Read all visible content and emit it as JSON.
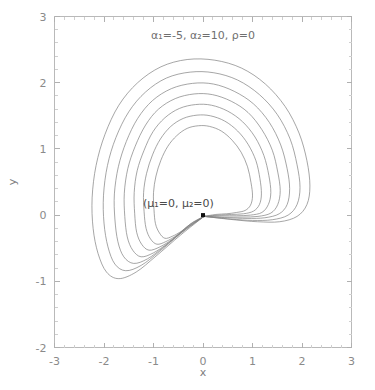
{
  "figure": {
    "name": "contour-plot",
    "title": "α₁=-5, α₂=10, ρ=0",
    "annotation": "(μ₁=0, μ₂=0)",
    "background": "#ffffff",
    "contour_color": "#7f7f7f",
    "marker_color": "#111111",
    "frame_color": "#b9b9b9"
  },
  "axes": {
    "x": {
      "label": "x",
      "ticks": [
        "-3",
        "-2",
        "-1",
        "0",
        "1",
        "2",
        "3"
      ],
      "tick_values": [
        -3,
        -2,
        -1,
        0,
        1,
        2,
        3
      ],
      "range": [
        -3,
        3
      ],
      "minor_per_interval": 4
    },
    "y": {
      "label": "y",
      "ticks": [
        "3",
        "2",
        "1",
        "0",
        "-1",
        "-2"
      ],
      "tick_values": [
        3,
        2,
        1,
        0,
        -1,
        -2
      ],
      "range": [
        -2,
        3
      ],
      "minor_per_interval": 4
    }
  },
  "chart_data": {
    "type": "line",
    "subtype": "contour",
    "title": "α₁=-5, α₂=10, ρ=0",
    "xlabel": "x",
    "ylabel": "y",
    "xlim": [
      -3,
      3
    ],
    "ylim": [
      -2,
      3
    ],
    "grid": false,
    "legend": false,
    "parameters": {
      "alpha_1": -5,
      "alpha_2": 10,
      "rho": 0,
      "mu_1": 0,
      "mu_2": 0
    },
    "annotations": [
      {
        "text": "(μ₁=0, μ₂=0)",
        "x": -0.3,
        "y": 0.15,
        "anchor": "start"
      }
    ],
    "markers": [
      {
        "name": "mean-point",
        "x": 0,
        "y": 0,
        "shape": "square",
        "color": "#111111",
        "size": 4
      }
    ],
    "n_contours": 7,
    "series": [
      {
        "name": "contour-1-outermost",
        "level": 0.01,
        "closed": true,
        "points": [
          [
            0.02,
            -0.02
          ],
          [
            -0.45,
            -0.3
          ],
          [
            -0.95,
            -0.62
          ],
          [
            -1.35,
            -0.86
          ],
          [
            -1.7,
            -0.96
          ],
          [
            -1.95,
            -0.86
          ],
          [
            -2.12,
            -0.58
          ],
          [
            -2.22,
            -0.2
          ],
          [
            -2.24,
            0.26
          ],
          [
            -2.16,
            0.75
          ],
          [
            -1.98,
            1.22
          ],
          [
            -1.7,
            1.66
          ],
          [
            -1.32,
            2.0
          ],
          [
            -0.85,
            2.24
          ],
          [
            -0.32,
            2.35
          ],
          [
            0.24,
            2.34
          ],
          [
            0.78,
            2.22
          ],
          [
            1.26,
            1.98
          ],
          [
            1.66,
            1.64
          ],
          [
            1.94,
            1.24
          ],
          [
            2.1,
            0.82
          ],
          [
            2.16,
            0.44
          ],
          [
            2.1,
            0.16
          ],
          [
            1.9,
            -0.02
          ],
          [
            1.55,
            -0.1
          ],
          [
            1.1,
            -0.1
          ],
          [
            0.62,
            -0.07
          ],
          [
            0.02,
            -0.02
          ]
        ]
      },
      {
        "name": "contour-2",
        "level": 0.02,
        "closed": true,
        "points": [
          [
            0.02,
            -0.02
          ],
          [
            -0.42,
            -0.26
          ],
          [
            -0.88,
            -0.55
          ],
          [
            -1.25,
            -0.76
          ],
          [
            -1.56,
            -0.84
          ],
          [
            -1.78,
            -0.74
          ],
          [
            -1.92,
            -0.48
          ],
          [
            -2.0,
            -0.12
          ],
          [
            -2.01,
            0.3
          ],
          [
            -1.93,
            0.75
          ],
          [
            -1.76,
            1.17
          ],
          [
            -1.5,
            1.56
          ],
          [
            -1.16,
            1.86
          ],
          [
            -0.74,
            2.07
          ],
          [
            -0.26,
            2.16
          ],
          [
            0.22,
            2.15
          ],
          [
            0.7,
            2.04
          ],
          [
            1.14,
            1.82
          ],
          [
            1.5,
            1.52
          ],
          [
            1.76,
            1.15
          ],
          [
            1.9,
            0.76
          ],
          [
            1.96,
            0.42
          ],
          [
            1.9,
            0.16
          ],
          [
            1.72,
            0.0
          ],
          [
            1.4,
            -0.07
          ],
          [
            1.0,
            -0.08
          ],
          [
            0.56,
            -0.06
          ],
          [
            0.02,
            -0.02
          ]
        ]
      },
      {
        "name": "contour-3",
        "level": 0.04,
        "closed": true,
        "points": [
          [
            0.02,
            -0.02
          ],
          [
            -0.38,
            -0.23
          ],
          [
            -0.79,
            -0.48
          ],
          [
            -1.12,
            -0.66
          ],
          [
            -1.4,
            -0.73
          ],
          [
            -1.6,
            -0.63
          ],
          [
            -1.72,
            -0.4
          ],
          [
            -1.78,
            -0.06
          ],
          [
            -1.79,
            0.32
          ],
          [
            -1.71,
            0.73
          ],
          [
            -1.55,
            1.11
          ],
          [
            -1.32,
            1.46
          ],
          [
            -1.02,
            1.73
          ],
          [
            -0.64,
            1.91
          ],
          [
            -0.21,
            1.99
          ],
          [
            0.21,
            1.98
          ],
          [
            0.63,
            1.87
          ],
          [
            1.02,
            1.68
          ],
          [
            1.34,
            1.4
          ],
          [
            1.57,
            1.06
          ],
          [
            1.7,
            0.7
          ],
          [
            1.75,
            0.4
          ],
          [
            1.7,
            0.16
          ],
          [
            1.54,
            0.02
          ],
          [
            1.25,
            -0.04
          ],
          [
            0.89,
            -0.05
          ],
          [
            0.5,
            -0.04
          ],
          [
            0.02,
            -0.02
          ]
        ]
      },
      {
        "name": "contour-4",
        "level": 0.06,
        "closed": true,
        "points": [
          [
            0.02,
            -0.02
          ],
          [
            -0.34,
            -0.2
          ],
          [
            -0.7,
            -0.42
          ],
          [
            -1.0,
            -0.57
          ],
          [
            -1.25,
            -0.63
          ],
          [
            -1.42,
            -0.53
          ],
          [
            -1.53,
            -0.33
          ],
          [
            -1.58,
            -0.02
          ],
          [
            -1.59,
            0.33
          ],
          [
            -1.52,
            0.7
          ],
          [
            -1.37,
            1.04
          ],
          [
            -1.16,
            1.36
          ],
          [
            -0.9,
            1.6
          ],
          [
            -0.56,
            1.76
          ],
          [
            -0.18,
            1.83
          ],
          [
            0.19,
            1.82
          ],
          [
            0.57,
            1.72
          ],
          [
            0.91,
            1.55
          ],
          [
            1.19,
            1.29
          ],
          [
            1.4,
            0.98
          ],
          [
            1.51,
            0.65
          ],
          [
            1.56,
            0.37
          ],
          [
            1.51,
            0.16
          ],
          [
            1.37,
            0.03
          ],
          [
            1.11,
            -0.02
          ],
          [
            0.79,
            -0.03
          ],
          [
            0.44,
            -0.03
          ],
          [
            0.02,
            -0.02
          ]
        ]
      },
      {
        "name": "contour-5",
        "level": 0.09,
        "closed": true,
        "points": [
          [
            0.02,
            -0.02
          ],
          [
            -0.3,
            -0.17
          ],
          [
            -0.61,
            -0.36
          ],
          [
            -0.87,
            -0.48
          ],
          [
            -1.09,
            -0.53
          ],
          [
            -1.24,
            -0.44
          ],
          [
            -1.34,
            -0.26
          ],
          [
            -1.38,
            0.02
          ],
          [
            -1.39,
            0.34
          ],
          [
            -1.33,
            0.67
          ],
          [
            -1.19,
            0.98
          ],
          [
            -1.01,
            1.26
          ],
          [
            -0.77,
            1.47
          ],
          [
            -0.48,
            1.61
          ],
          [
            -0.15,
            1.67
          ],
          [
            0.17,
            1.66
          ],
          [
            0.5,
            1.57
          ],
          [
            0.8,
            1.41
          ],
          [
            1.05,
            1.18
          ],
          [
            1.23,
            0.9
          ],
          [
            1.33,
            0.6
          ],
          [
            1.37,
            0.34
          ],
          [
            1.32,
            0.16
          ],
          [
            1.19,
            0.04
          ],
          [
            0.96,
            0.0
          ],
          [
            0.68,
            -0.01
          ],
          [
            0.38,
            -0.01
          ],
          [
            0.02,
            -0.02
          ]
        ]
      },
      {
        "name": "contour-6",
        "level": 0.12,
        "closed": true,
        "points": [
          [
            0.02,
            -0.02
          ],
          [
            -0.26,
            -0.14
          ],
          [
            -0.52,
            -0.3
          ],
          [
            -0.75,
            -0.4
          ],
          [
            -0.93,
            -0.44
          ],
          [
            -1.06,
            -0.36
          ],
          [
            -1.15,
            -0.2
          ],
          [
            -1.19,
            0.05
          ],
          [
            -1.2,
            0.34
          ],
          [
            -1.14,
            0.63
          ],
          [
            -1.02,
            0.91
          ],
          [
            -0.86,
            1.15
          ],
          [
            -0.65,
            1.34
          ],
          [
            -0.4,
            1.46
          ],
          [
            -0.12,
            1.51
          ],
          [
            0.15,
            1.5
          ],
          [
            0.44,
            1.42
          ],
          [
            0.7,
            1.27
          ],
          [
            0.91,
            1.07
          ],
          [
            1.07,
            0.82
          ],
          [
            1.15,
            0.55
          ],
          [
            1.18,
            0.32
          ],
          [
            1.14,
            0.16
          ],
          [
            1.02,
            0.06
          ],
          [
            0.82,
            0.02
          ],
          [
            0.58,
            0.01
          ],
          [
            0.32,
            0.0
          ],
          [
            0.02,
            -0.02
          ]
        ]
      },
      {
        "name": "contour-7-innermost",
        "level": 0.16,
        "closed": true,
        "points": [
          [
            0.02,
            -0.02
          ],
          [
            -0.21,
            -0.11
          ],
          [
            -0.43,
            -0.24
          ],
          [
            -0.62,
            -0.32
          ],
          [
            -0.77,
            -0.35
          ],
          [
            -0.88,
            -0.27
          ],
          [
            -0.96,
            -0.13
          ],
          [
            -0.99,
            0.08
          ],
          [
            -1.0,
            0.34
          ],
          [
            -0.95,
            0.59
          ],
          [
            -0.85,
            0.83
          ],
          [
            -0.71,
            1.04
          ],
          [
            -0.53,
            1.2
          ],
          [
            -0.32,
            1.31
          ],
          [
            -0.09,
            1.35
          ],
          [
            0.13,
            1.34
          ],
          [
            0.37,
            1.27
          ],
          [
            0.59,
            1.13
          ],
          [
            0.77,
            0.95
          ],
          [
            0.9,
            0.73
          ],
          [
            0.97,
            0.49
          ],
          [
            1.0,
            0.29
          ],
          [
            0.96,
            0.15
          ],
          [
            0.85,
            0.07
          ],
          [
            0.68,
            0.04
          ],
          [
            0.48,
            0.02
          ],
          [
            0.26,
            0.01
          ],
          [
            0.02,
            -0.02
          ]
        ]
      }
    ]
  }
}
